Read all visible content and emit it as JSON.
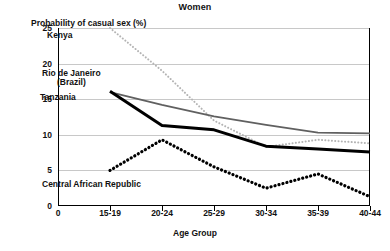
{
  "chart_data": {
    "type": "line",
    "title": "Women",
    "xlabel": "Age Group",
    "ylabel": "Probability of casual sex (%)",
    "categories": [
      "15-19",
      "20-24",
      "25-29",
      "30-34",
      "35-39",
      "40-44"
    ],
    "x_origin_label": "0",
    "xlim": [
      0,
      6
    ],
    "ylim": [
      0,
      25
    ],
    "yticks": [
      0,
      5,
      10,
      15,
      20,
      25
    ],
    "ytick_labels": [
      "0",
      "5",
      "10",
      "15",
      "20",
      "25"
    ],
    "grid": true,
    "legend": "inline-annotations",
    "series": [
      {
        "name": "Kenya",
        "style": "fine-dotted",
        "color": "#b4b4b4",
        "values": [
          25.0,
          19.0,
          12.0,
          8.3,
          9.3,
          8.8
        ]
      },
      {
        "name": "Rio de Janeiro (Brazil)",
        "style": "solid",
        "color": "#606060",
        "values": [
          16.0,
          14.2,
          12.6,
          11.4,
          10.3,
          10.2
        ]
      },
      {
        "name": "Tanzania",
        "style": "thick-solid",
        "color": "#000000",
        "values": [
          16.1,
          11.3,
          10.7,
          8.4,
          8.0,
          7.6
        ]
      },
      {
        "name": "Central African Republic",
        "style": "bold-dotted",
        "color": "#000000",
        "values": [
          5.0,
          9.3,
          5.5,
          2.5,
          4.5,
          1.3
        ]
      }
    ],
    "annotations": [
      {
        "text": "Kenya",
        "x_px": 47,
        "y_px": 31
      },
      {
        "text": "Rio de Janeiro",
        "x_px": 42,
        "y_px": 69
      },
      {
        "text": "(Brazil)",
        "x_px": 57,
        "y_px": 78
      },
      {
        "text": "Tanzania",
        "x_px": 40,
        "y_px": 93
      },
      {
        "text": "Central African Republic",
        "x_px": 42,
        "y_px": 180
      }
    ]
  }
}
